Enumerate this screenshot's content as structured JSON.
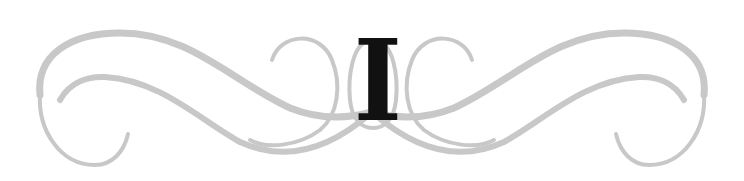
{
  "ornament": {
    "chapter_letter": "I",
    "colors": {
      "flourish": "#c8c8c8",
      "letter": "#111111",
      "background": "#ffffff"
    }
  }
}
